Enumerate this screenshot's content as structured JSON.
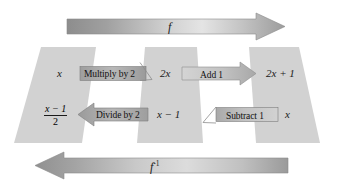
{
  "diagram": {
    "colors": {
      "band_fill": "#d2d2d2",
      "arrow_light": "#d9d9d9",
      "arrow_mid": "#a9a9a9",
      "arrow_dark": "#8f8f8f",
      "op_fill": "#a8a8a8",
      "op_fill_light": "#c9c9c9",
      "stroke": "#7a7a7a",
      "text": "#1a1a1a",
      "background": "#ffffff"
    },
    "top_arrow": {
      "label": "f",
      "direction": "right",
      "name": "forward-function-arrow"
    },
    "bottom_arrow": {
      "label": "f",
      "superscript": "-1",
      "direction": "left",
      "name": "inverse-function-arrow"
    },
    "forward_row": {
      "nodes": [
        {
          "id": "input-x",
          "text": "x",
          "style": "italic"
        },
        {
          "id": "intermediate-2x",
          "text": "2x",
          "style": "mixed"
        },
        {
          "id": "output-2x-plus-1",
          "text": "2x + 1",
          "style": "mixed"
        }
      ],
      "operations": [
        {
          "id": "multiply-by-2",
          "label": "Multiply by 2",
          "direction": "right"
        },
        {
          "id": "add-1",
          "label": "Add 1",
          "direction": "right"
        }
      ]
    },
    "inverse_row": {
      "nodes": [
        {
          "id": "inverse-output-fraction",
          "numerator": "x − 1",
          "denominator": "2",
          "style": "fraction"
        },
        {
          "id": "intermediate-x-minus-1",
          "text": "x − 1",
          "style": "mixed"
        },
        {
          "id": "inverse-input-x",
          "text": "x",
          "style": "italic"
        }
      ],
      "operations": [
        {
          "id": "divide-by-2",
          "label": "Divide by 2",
          "direction": "left"
        },
        {
          "id": "subtract-1",
          "label": "Subtract 1",
          "direction": "left"
        }
      ]
    },
    "bands": [
      {
        "id": "band-left",
        "name": "value-band-left"
      },
      {
        "id": "band-middle",
        "name": "value-band-middle"
      },
      {
        "id": "band-right",
        "name": "value-band-right"
      }
    ]
  }
}
